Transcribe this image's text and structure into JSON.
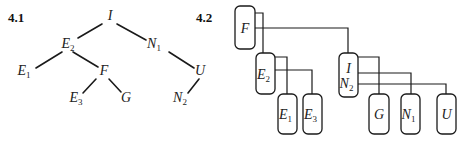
{
  "panels": [
    {
      "id": "4.1",
      "label": "4.1"
    },
    {
      "id": "4.2",
      "label": "4.2"
    }
  ],
  "tree_4_1": {
    "nodes": [
      {
        "id": "I",
        "base": "I",
        "sub": "",
        "x": 110,
        "y": 20
      },
      {
        "id": "E2",
        "base": "E",
        "sub": "2",
        "x": 68,
        "y": 48
      },
      {
        "id": "N1",
        "base": "N",
        "sub": "1",
        "x": 154,
        "y": 48
      },
      {
        "id": "E1",
        "base": "E",
        "sub": "1",
        "x": 24,
        "y": 75
      },
      {
        "id": "F",
        "base": "F",
        "sub": "",
        "x": 104,
        "y": 75
      },
      {
        "id": "U",
        "base": "U",
        "sub": "",
        "x": 200,
        "y": 75
      },
      {
        "id": "E3",
        "base": "E",
        "sub": "3",
        "x": 76,
        "y": 102
      },
      {
        "id": "G",
        "base": "G",
        "sub": "",
        "x": 126,
        "y": 102
      },
      {
        "id": "N2",
        "base": "N",
        "sub": "2",
        "x": 180,
        "y": 102
      }
    ],
    "edges": [
      {
        "from": "I",
        "to": "E2",
        "x1": 102,
        "y1": 24,
        "x2": 78,
        "y2": 38
      },
      {
        "from": "I",
        "to": "N1",
        "x1": 117,
        "y1": 24,
        "x2": 146,
        "y2": 40
      },
      {
        "from": "E2",
        "to": "E1",
        "x1": 62,
        "y1": 52,
        "x2": 36,
        "y2": 68
      },
      {
        "from": "E2",
        "to": "F",
        "x1": 73,
        "y1": 52,
        "x2": 98,
        "y2": 67
      },
      {
        "from": "F",
        "to": "E3",
        "x1": 96,
        "y1": 79,
        "x2": 83,
        "y2": 93
      },
      {
        "from": "F",
        "to": "G",
        "x1": 109,
        "y1": 79,
        "x2": 121,
        "y2": 92
      },
      {
        "from": "N1",
        "to": "U",
        "x1": 169,
        "y1": 52,
        "x2": 194,
        "y2": 68
      },
      {
        "from": "U",
        "to": "N2",
        "x1": 199,
        "y1": 79,
        "x2": 188,
        "y2": 93
      }
    ]
  },
  "tree_4_2": {
    "boxes": [
      {
        "id": "F",
        "lines": [
          {
            "base": "F",
            "sub": ""
          }
        ],
        "x": 235,
        "y": 6,
        "w": 20,
        "h": 43
      },
      {
        "id": "E2",
        "lines": [
          {
            "base": "E",
            "sub": "2"
          }
        ],
        "x": 256,
        "y": 53,
        "w": 19,
        "h": 41
      },
      {
        "id": "IN2",
        "lines": [
          {
            "base": "I",
            "sub": ""
          },
          {
            "base": "N",
            "sub": "2"
          }
        ],
        "x": 339,
        "y": 53,
        "w": 19,
        "h": 44
      },
      {
        "id": "E1",
        "lines": [
          {
            "base": "E",
            "sub": "1"
          }
        ],
        "x": 278,
        "y": 94,
        "w": 19,
        "h": 40
      },
      {
        "id": "E3",
        "lines": [
          {
            "base": "E",
            "sub": "3"
          }
        ],
        "x": 303,
        "y": 94,
        "w": 19,
        "h": 40
      },
      {
        "id": "G",
        "lines": [
          {
            "base": "G",
            "sub": ""
          }
        ],
        "x": 369,
        "y": 94,
        "w": 20,
        "h": 40
      },
      {
        "id": "N1",
        "lines": [
          {
            "base": "N",
            "sub": "1"
          }
        ],
        "x": 401,
        "y": 94,
        "w": 19,
        "h": 40
      },
      {
        "id": "U",
        "lines": [
          {
            "base": "U",
            "sub": ""
          }
        ],
        "x": 437,
        "y": 94,
        "w": 19,
        "h": 40
      }
    ],
    "connectors": [
      {
        "from": "F",
        "to": "E2",
        "points": "255,13 263,13 263,53"
      },
      {
        "from": "F",
        "to": "IN2",
        "points": "245,28 348,28 348,53"
      },
      {
        "from": "E2",
        "to": "E1",
        "points": "275,57 287,57 287,94"
      },
      {
        "from": "E2",
        "to": "E3",
        "points": "264,70 312,70 312,94"
      },
      {
        "from": "IN2",
        "to": "G",
        "points": "358,57 379,57 379,94"
      },
      {
        "from": "IN2",
        "to": "N1",
        "points": "358,73 411,73 411,94"
      },
      {
        "from": "IN2",
        "to": "U",
        "points": "358,84 446,84 446,94"
      }
    ]
  }
}
